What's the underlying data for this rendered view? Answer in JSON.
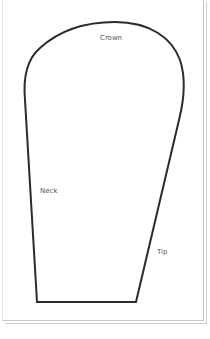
{
  "diagram": {
    "type": "template-outline",
    "stroke_color": "#2b2b2b",
    "labels": {
      "crown": "Crown",
      "neck": "Neck",
      "tip": "Tip"
    }
  }
}
